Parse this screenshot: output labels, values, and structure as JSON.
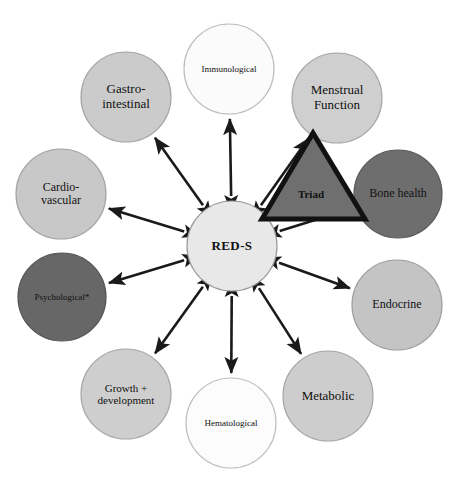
{
  "figure": {
    "type": "radial-hub-and-spoke-diagram",
    "background_color": "#ffffff",
    "hub": {
      "label": "RED-S",
      "cx": 232,
      "cy": 246,
      "r": 45,
      "fill": "#e8e8e8",
      "stroke": "#9a9a9a",
      "font_size": 13
    },
    "triangle": {
      "label": "Triad",
      "points": "313,133 365,219 262,219",
      "fill": "#6f6f6f",
      "stroke": "#111111",
      "stroke_width": 5,
      "label_x": 311,
      "label_y": 194,
      "font_size": 11
    },
    "arrow": {
      "color": "#1a1a1a",
      "width": 2.6,
      "double_headed": true
    },
    "nodes": [
      {
        "id": "immunological",
        "label": "Immunological",
        "cx": 229,
        "cy": 69,
        "r": 45,
        "fill": "#fbfbfb",
        "stroke": "#bdbdbd",
        "font_size": 9,
        "angle_deg": 270
      },
      {
        "id": "menstrual-function",
        "label": "Menstrual\nFunction",
        "cx": 337,
        "cy": 98,
        "r": 45,
        "fill": "#cfcfcf",
        "stroke": "#a8a8a8",
        "font_size": 13,
        "angle_deg": 315
      },
      {
        "id": "bone-health",
        "label": "Bone health",
        "cx": 398,
        "cy": 194,
        "r": 44,
        "fill": "#6e6e6e",
        "stroke": "#5a5a5a",
        "font_size": 12,
        "angle_deg": 0
      },
      {
        "id": "endocrine",
        "label": "Endocrine",
        "cx": 397,
        "cy": 305,
        "r": 45,
        "fill": "#c4c4c4",
        "stroke": "#a0a0a0",
        "font_size": 12,
        "angle_deg": 30
      },
      {
        "id": "metabolic",
        "label": "Metabolic",
        "cx": 328,
        "cy": 396,
        "r": 45,
        "fill": "#cdcdcd",
        "stroke": "#a8a8a8",
        "font_size": 13,
        "angle_deg": 60
      },
      {
        "id": "hematological",
        "label": "Hematological",
        "cx": 231,
        "cy": 423,
        "r": 45,
        "fill": "#fcfcfc",
        "stroke": "#c0c0c0",
        "font_size": 9,
        "angle_deg": 90
      },
      {
        "id": "growth-development",
        "label": "Growth +\ndevelopment",
        "cx": 126,
        "cy": 394,
        "r": 45,
        "fill": "#cecece",
        "stroke": "#a8a8a8",
        "font_size": 11,
        "angle_deg": 120
      },
      {
        "id": "psychological",
        "label": "Psychological*",
        "cx": 62,
        "cy": 297,
        "r": 44,
        "fill": "#676767",
        "stroke": "#565656",
        "font_size": 9,
        "angle_deg": 150
      },
      {
        "id": "cardiovascular",
        "label": "Cardio-\nvascular",
        "cx": 61,
        "cy": 194,
        "r": 45,
        "fill": "#c8c8c8",
        "stroke": "#a4a4a4",
        "font_size": 12,
        "angle_deg": 185
      },
      {
        "id": "gastro-intestinal",
        "label": "Gastro-\nintestinal",
        "cx": 126,
        "cy": 97,
        "r": 45,
        "fill": "#cbcbcb",
        "stroke": "#a6a6a6",
        "font_size": 13,
        "angle_deg": 225
      }
    ]
  }
}
